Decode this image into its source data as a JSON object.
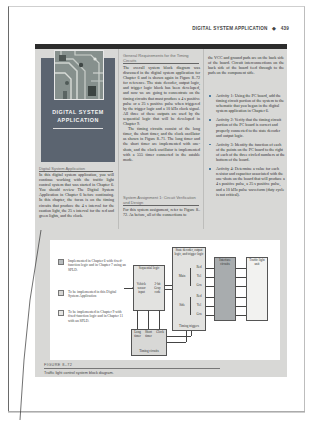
{
  "running_head": {
    "title": "DIGITAL SYSTEM APPLICATION",
    "bullet": "◆",
    "page_number": "439"
  },
  "hero": {
    "title_line1": "DIGITAL SYSTEM",
    "title_line2": "APPLICATION"
  },
  "column1": {
    "heading": "Digital System Application",
    "paragraph": "In this digital system application, you will continue working with the traffic light control system that was started in Chapter 6. You should review The Digital System Application in Chapter 6 before continuing. In this chapter, the focus is on the timing circuits that produce the 4 s interval for the caution light, the 25 s interval for the red and green lights, and the clock."
  },
  "column2": {
    "heading": "General Requirements for the Timing Circuits",
    "paragraph1": "The overall system block diagram was discussed in the digital system application for Chapter 6 and is shown again in Figure 8–72 for reference. The state decoder, output logic, and trigger logic block has been developed, and now we are going to concentrate on the timing circuits that must produce a 4 s positive pulse or a 25 s positive pulse when triggered by the trigger logic and a 10 kHz clock signal. All three of these outputs are used by the sequential logic that will be developed in Chapter 9.",
    "paragraph2": "The timing circuits consist of the long timer, the short timer, and the clock oscillator as shown in Figure 8–71. The long timer and the short timer are implemented with one-shots, and the clock oscillator is implemented with a 555 timer connected in the astable mode.",
    "heading2": "System Assignment 1: Circuit Verification and Design",
    "paragraph3": "For this system assignment, refer to Figure 8–72. As before, all of the connections to"
  },
  "column3": {
    "paragraph": "the VCC and ground pads are on the back side of the board. Circuit interconnections on the back side of the board feed through to the pads on the component side.",
    "activities": [
      {
        "label": "Activity 1:",
        "text": "Using the PC board, add the timing circuit portion of the system to the schematic that you began in the digital system application in Chapter 6."
      },
      {
        "label": "Activity 2:",
        "text": "Verify that the timing circuit portion of the PC board is correct and properly connected to the state decoder and output logic."
      },
      {
        "label": "Activity 3:",
        "text": "Identify the function of each of the points on the PC board to the right of each of the three circled numbers at the bottom of the board."
      },
      {
        "label": "Activity 4:",
        "text": "Determine a value for each resistor and capacitor associated with the one-shots on the board that will produce a 4 s positive pulse, a 25 s positive pulse, and a 10 kHz pulse waveform (duty cycle is not critical)."
      }
    ]
  },
  "figure": {
    "legend": [
      {
        "text": "Implemented in Chapter 6 with fixed-function logic and in Chapter 7 using an SPLD.",
        "color": "#b8bcbe"
      },
      {
        "text": "To be implemented in this Digital System Application",
        "color": "#d6d6d4"
      },
      {
        "text": "To be implemented in Chapter 9 with fixed-function logic and in Chapter 11 with an SPLD.",
        "color": "#e6e6e4"
      }
    ],
    "blocks": {
      "sequential_logic": {
        "title": "Sequential logic",
        "left_label": "Vehicle sensor input",
        "right_label": "2-bit Gray code"
      },
      "state_decoder": {
        "title": "State decoder, output logic, and trigger logic",
        "main_label": "Main",
        "side_label": "Side",
        "outputs": [
          "Red",
          "Yel",
          "Grn",
          "Red",
          "Yel",
          "Grn"
        ],
        "bottom_label": "Timing triggers"
      },
      "interface": {
        "title": "Interface circuits"
      },
      "traffic_light": {
        "title": "Traffic light unit"
      },
      "timing": {
        "labels": [
          "Long timer",
          "Short timer",
          "Clock"
        ],
        "title": "Timing circuits"
      }
    },
    "caption_label": "FIGURE 8–72",
    "caption_text": "Traffic light control system block diagram."
  }
}
